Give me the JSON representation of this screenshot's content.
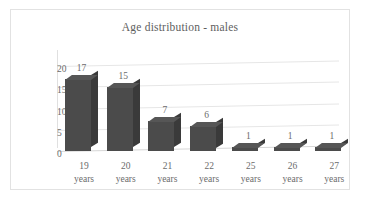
{
  "chart_data": {
    "type": "bar",
    "title": "Age distribution - males",
    "xlabel": "",
    "ylabel": "",
    "categories": [
      "19 years",
      "20 years",
      "21 years",
      "22 years",
      "25 years",
      "26 years",
      "27 years"
    ],
    "category_lines": [
      [
        "19",
        "years"
      ],
      [
        "20",
        "years"
      ],
      [
        "21",
        "years"
      ],
      [
        "22",
        "years"
      ],
      [
        "25",
        "years"
      ],
      [
        "26",
        "years"
      ],
      [
        "27",
        "years"
      ]
    ],
    "values": [
      17,
      15,
      7,
      6,
      1,
      1,
      1
    ],
    "data_labels": [
      "17",
      "15",
      "7",
      "6",
      "1",
      "1",
      "1"
    ],
    "ylim": [
      0,
      20
    ],
    "yticks": [
      0,
      5,
      10,
      15,
      20
    ],
    "ytick_labels": [
      "0",
      "5",
      "10",
      "15",
      "20"
    ],
    "grid": true,
    "legend": false,
    "legend_position": "none",
    "style": "3d-column",
    "colors": {
      "bar_front": "#4b4b4b",
      "bar_side": "#3a3a3a",
      "bar_top": "#565656",
      "gridline": "#e6e6e6",
      "text": "#6b6b6b",
      "title_text": "#5e5e5e",
      "border": "#e2e2e2",
      "background": "#ffffff"
    }
  }
}
